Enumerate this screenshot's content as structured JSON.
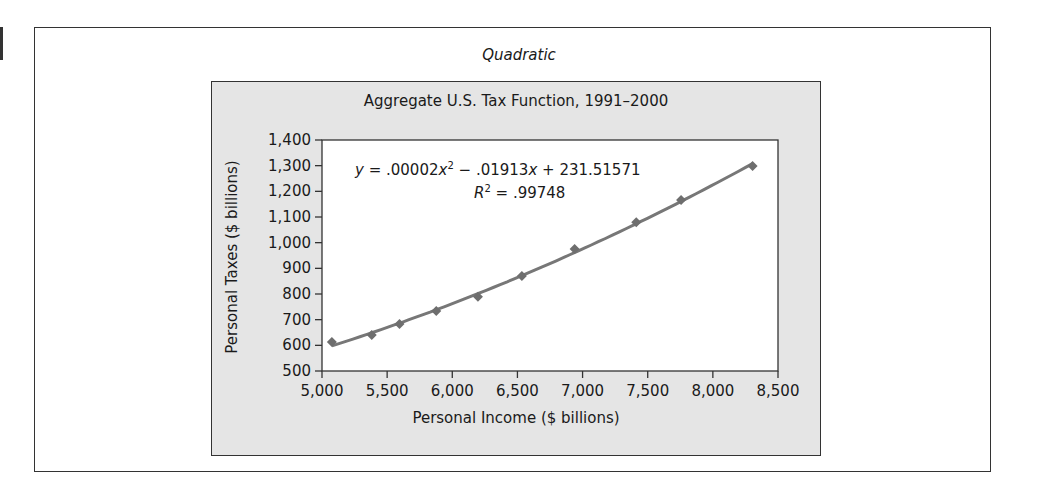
{
  "figure": {
    "subtitle": "Quadratic",
    "title": "Aggregate U.S. Tax Function, 1991–2000",
    "xlabel": "Personal Income ($ billions)",
    "ylabel": "Personal Taxes ($ billions)",
    "equation": {
      "y_var": "y",
      "eq_sign": " = ",
      "c2": ".00002",
      "x1": "x",
      "p2": "2",
      "minus": " − ",
      "c1": ".01913",
      "x2": "x",
      "plus": " + ",
      "c0": "231.51571"
    },
    "r2": {
      "r": "R",
      "p": "2",
      "rest": " = .99748"
    }
  },
  "colors": {
    "panel": "#e5e5e5",
    "line": "#777777",
    "marker": "#6e6e6e",
    "frame": "#333333"
  },
  "chart_data": {
    "type": "scatter",
    "title": "Aggregate U.S. Tax Function, 1991–2000",
    "subtitle": "Quadratic",
    "xlabel": "Personal Income ($ billions)",
    "ylabel": "Personal Taxes ($ billions)",
    "xlim": [
      5000,
      8500
    ],
    "ylim": [
      500,
      1400
    ],
    "x_ticks": [
      5000,
      5500,
      6000,
      6500,
      7000,
      7500,
      8000,
      8500
    ],
    "x_tick_labels": [
      "5,000",
      "5,500",
      "6,000",
      "6,500",
      "7,000",
      "7,500",
      "8,000",
      "8,500"
    ],
    "y_ticks": [
      500,
      600,
      700,
      800,
      900,
      1000,
      1100,
      1200,
      1300,
      1400
    ],
    "y_tick_labels": [
      "500",
      "600",
      "700",
      "800",
      "900",
      "1,000",
      "1,100",
      "1,200",
      "1,300",
      "1,400"
    ],
    "grid": false,
    "legend": null,
    "series": [
      {
        "name": "Personal Taxes",
        "marker": "diamond",
        "x": [
          5076,
          5382,
          5595,
          5877,
          6197,
          6534,
          6939,
          7412,
          7756,
          8305
        ],
        "y": [
          613,
          640,
          683,
          734,
          789,
          870,
          975,
          1080,
          1166,
          1299
        ]
      }
    ],
    "trendline": {
      "type": "polynomial-2",
      "equation": "y = .00002x^2 − .01913x + 231.51571",
      "r_squared": 0.99748,
      "x_range": [
        5076,
        8305
      ]
    },
    "annotations": [
      "y = .00002x² − .01913x + 231.51571",
      "R² = .99748"
    ]
  }
}
